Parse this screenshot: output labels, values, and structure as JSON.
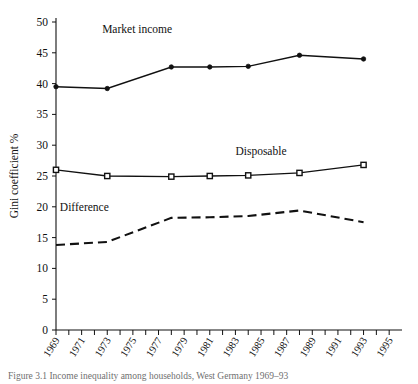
{
  "figure": {
    "caption": "Figure 3.1  Income inequality among households, West Germany 1969–93"
  },
  "chart_data": {
    "type": "line",
    "title": "",
    "xlabel": "",
    "ylabel": "Gini coefficient %",
    "xlim": [
      1969,
      1996
    ],
    "ylim": [
      0,
      50
    ],
    "ytick_step": 5,
    "grid": false,
    "legend_position": "inline-annotations",
    "yticks": [
      0,
      5,
      10,
      15,
      20,
      25,
      30,
      35,
      40,
      45,
      50
    ],
    "xticks": [
      1969,
      1970,
      1971,
      1972,
      1973,
      1974,
      1975,
      1976,
      1977,
      1978,
      1979,
      1980,
      1981,
      1982,
      1983,
      1984,
      1985,
      1986,
      1987,
      1988,
      1989,
      1990,
      1991,
      1992,
      1993,
      1994,
      1995
    ],
    "xtick_labels": [
      "1969",
      "",
      "1971",
      "",
      "1973",
      "",
      "1975",
      "",
      "1977",
      "",
      "1979",
      "",
      "1981",
      "",
      "1983",
      "",
      "1985",
      "",
      "1987",
      "",
      "1989",
      "",
      "1991",
      "",
      "1993",
      "",
      "1995"
    ],
    "series": [
      {
        "name": "Market income",
        "marker": "filled-circle",
        "linestyle": "solid",
        "label_x": 1972.6,
        "label_y": 48.2,
        "x": [
          1969,
          1973,
          1978,
          1981,
          1984,
          1988,
          1993
        ],
        "values": [
          39.5,
          39.2,
          42.7,
          42.7,
          42.8,
          44.6,
          44.0
        ]
      },
      {
        "name": "Disposable",
        "marker": "open-square",
        "linestyle": "solid",
        "label_x": 1983.0,
        "label_y": 28.4,
        "x": [
          1969,
          1973,
          1978,
          1981,
          1984,
          1988,
          1993
        ],
        "values": [
          26.0,
          25.0,
          24.9,
          25.0,
          25.1,
          25.5,
          26.8
        ]
      },
      {
        "name": "Difference",
        "marker": "none",
        "linestyle": "dashed",
        "label_x": 1969.3,
        "label_y": 19.3,
        "x": [
          1969,
          1973,
          1978,
          1981,
          1984,
          1988,
          1993
        ],
        "values": [
          13.8,
          14.3,
          18.2,
          18.3,
          18.5,
          19.4,
          17.5
        ]
      }
    ]
  }
}
